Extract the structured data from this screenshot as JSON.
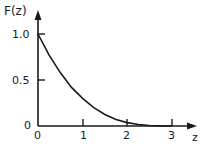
{
  "chart_data": {
    "type": "line",
    "title": "",
    "xlabel": "z",
    "ylabel": "F(z)",
    "xlim": [
      0,
      3.4
    ],
    "ylim": [
      0,
      1.15
    ],
    "x_ticks": [
      "0",
      "1",
      "2",
      "3"
    ],
    "y_ticks": [
      "0",
      "0.5",
      "1.0"
    ],
    "grid": false,
    "legend": null,
    "series": [
      {
        "name": "F(z)",
        "x": [
          0,
          0.25,
          0.5,
          0.75,
          1.0,
          1.25,
          1.5,
          1.75,
          2.0,
          2.25,
          2.5,
          2.75,
          3.0
        ],
        "values": [
          1.0,
          0.77,
          0.58,
          0.42,
          0.3,
          0.2,
          0.125,
          0.07,
          0.037,
          0.016,
          0.005,
          0.001,
          0.0
        ]
      }
    ],
    "color": "#1a1a1a"
  },
  "labels": {
    "ylabel": "F(z)",
    "xlabel": "z",
    "y1": "1.0",
    "y05": "0.5",
    "y0": "0",
    "x0": "0",
    "x1": "1",
    "x2": "2",
    "x3": "3"
  }
}
